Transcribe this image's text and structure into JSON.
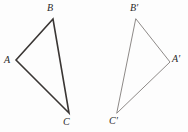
{
  "figure": {
    "background_color": "#fdfdfd",
    "canvas": {
      "width": 188,
      "height": 132
    },
    "label_color": "#2a2a2a"
  },
  "shapes": [
    {
      "name": "triangle-abc",
      "stroke_color": "#3a3634",
      "stroke_width": 1.6,
      "fill": "none",
      "points": "16,60 53,19 69,113",
      "vertices": [
        {
          "id": "A",
          "x": 16,
          "y": 60
        },
        {
          "id": "B",
          "x": 53,
          "y": 19
        },
        {
          "id": "C",
          "x": 69,
          "y": 113
        }
      ]
    },
    {
      "name": "triangle-a-prime-b-prime-c-prime",
      "stroke_color": "#8e8a88",
      "stroke_width": 1.0,
      "fill": "none",
      "points": "136,19 170,62 117,113",
      "vertices": [
        {
          "id": "B'",
          "x": 136,
          "y": 19
        },
        {
          "id": "A'",
          "x": 170,
          "y": 62
        },
        {
          "id": "C'",
          "x": 117,
          "y": 113
        }
      ]
    }
  ],
  "labels": {
    "a": {
      "text": "A",
      "x": 4,
      "y": 55
    },
    "b": {
      "text": "B",
      "x": 47,
      "y": 3
    },
    "c": {
      "text": "C",
      "x": 63,
      "y": 117
    },
    "a_prime": {
      "text": "A′",
      "x": 172,
      "y": 54
    },
    "b_prime": {
      "text": "B′",
      "x": 130,
      "y": 3
    },
    "c_prime": {
      "text": "C′",
      "x": 109,
      "y": 116
    }
  }
}
